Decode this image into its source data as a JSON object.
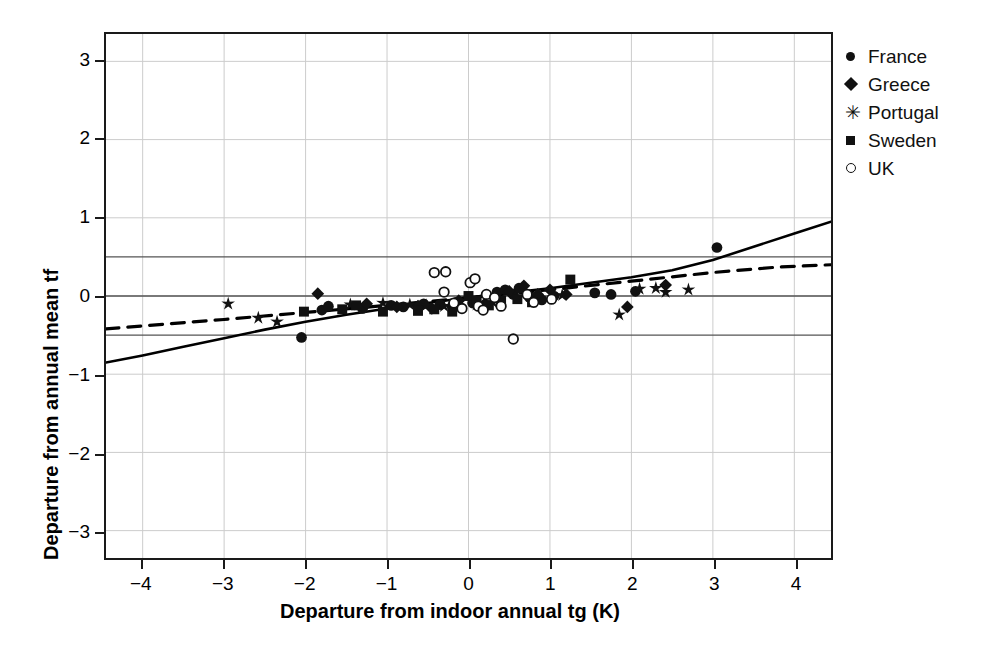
{
  "figure": {
    "caption_fragment": ""
  },
  "legend": {
    "position": "right",
    "entries": [
      {
        "label": "France",
        "marker": "filled-circle"
      },
      {
        "label": "Greece",
        "marker": "filled-diamond"
      },
      {
        "label": "Portugal",
        "marker": "star"
      },
      {
        "label": "Sweden",
        "marker": "filled-square"
      },
      {
        "label": "UK",
        "marker": "open-circle"
      }
    ]
  },
  "colors": {
    "marker": "#111111",
    "axis": "#1a1a1a",
    "grid": "#cccccc",
    "reference_line": "#555555",
    "background": "#ffffff"
  },
  "chart_data": {
    "type": "scatter",
    "title": "",
    "xlabel": "Departure from indoor annual tg (K)",
    "ylabel": "Departure from annual mean tf",
    "xlim": [
      -4.45,
      4.45
    ],
    "ylim": [
      -3.35,
      3.35
    ],
    "xticks": [
      -4,
      -3,
      -2,
      -1,
      0,
      1,
      2,
      3,
      4
    ],
    "yticks": [
      -3,
      -2,
      -1,
      0,
      1,
      2,
      3
    ],
    "xtick_labels": [
      "−4",
      "−3",
      "−2",
      "−1",
      "0",
      "1",
      "2",
      "3",
      "4"
    ],
    "ytick_labels": [
      "−3",
      "−2",
      "−1",
      "0",
      "1",
      "2",
      "3"
    ],
    "grid": true,
    "reference_lines": [
      {
        "y": 0.5,
        "style": "solid",
        "label": "+0.5 K comfort band"
      },
      {
        "y": 0.0,
        "style": "solid",
        "label": "0 K"
      },
      {
        "y": -0.5,
        "style": "solid",
        "label": "-0.5 K comfort band"
      }
    ],
    "curves": [
      {
        "name": "adaptive model (solid)",
        "style": "solid",
        "points": [
          [
            -4.45,
            -0.85
          ],
          [
            -4.0,
            -0.76
          ],
          [
            -3.5,
            -0.65
          ],
          [
            -3.0,
            -0.54
          ],
          [
            -2.5,
            -0.43
          ],
          [
            -2.0,
            -0.33
          ],
          [
            -1.5,
            -0.24
          ],
          [
            -1.0,
            -0.16
          ],
          [
            -0.5,
            -0.09
          ],
          [
            0.0,
            -0.02
          ],
          [
            0.5,
            0.04
          ],
          [
            1.0,
            0.1
          ],
          [
            1.5,
            0.17
          ],
          [
            2.0,
            0.24
          ],
          [
            2.5,
            0.33
          ],
          [
            3.0,
            0.46
          ],
          [
            3.5,
            0.63
          ],
          [
            4.0,
            0.8
          ],
          [
            4.45,
            0.95
          ]
        ]
      },
      {
        "name": "linear regression (dashed)",
        "style": "dashed",
        "points": [
          [
            -4.45,
            -0.42
          ],
          [
            -3.0,
            -0.3
          ],
          [
            -2.0,
            -0.21
          ],
          [
            -1.0,
            -0.12
          ],
          [
            0.0,
            -0.02
          ],
          [
            1.0,
            0.08
          ],
          [
            2.0,
            0.19
          ],
          [
            3.0,
            0.3
          ],
          [
            3.8,
            0.37
          ],
          [
            4.45,
            0.4
          ]
        ]
      }
    ],
    "series": [
      {
        "name": "France",
        "marker": "filled-circle",
        "points": [
          [
            -2.05,
            -0.53
          ],
          [
            -1.8,
            -0.18
          ],
          [
            -1.72,
            -0.13
          ],
          [
            -1.3,
            -0.16
          ],
          [
            -0.95,
            -0.12
          ],
          [
            -0.8,
            -0.14
          ],
          [
            -0.55,
            -0.1
          ],
          [
            -0.35,
            -0.11
          ],
          [
            -0.2,
            -0.13
          ],
          [
            0.05,
            -0.09
          ],
          [
            0.35,
            0.05
          ],
          [
            0.45,
            0.08
          ],
          [
            0.55,
            0.02
          ],
          [
            0.62,
            0.1
          ],
          [
            0.75,
            -0.02
          ],
          [
            0.9,
            -0.05
          ],
          [
            1.05,
            0.0
          ],
          [
            1.55,
            0.04
          ],
          [
            1.75,
            0.02
          ],
          [
            2.05,
            0.06
          ],
          [
            3.05,
            0.62
          ]
        ]
      },
      {
        "name": "Greece",
        "marker": "filled-diamond",
        "points": [
          [
            -1.85,
            0.03
          ],
          [
            -1.25,
            -0.1
          ],
          [
            -0.88,
            -0.14
          ],
          [
            -0.62,
            -0.13
          ],
          [
            -0.45,
            -0.16
          ],
          [
            -0.12,
            -0.06
          ],
          [
            0.2,
            -0.1
          ],
          [
            0.5,
            0.06
          ],
          [
            0.68,
            0.13
          ],
          [
            0.85,
            0.02
          ],
          [
            1.0,
            0.08
          ],
          [
            1.2,
            0.02
          ],
          [
            1.95,
            -0.14
          ],
          [
            2.42,
            0.14
          ]
        ]
      },
      {
        "name": "Portugal",
        "marker": "star",
        "points": [
          [
            -2.95,
            -0.1
          ],
          [
            -2.58,
            -0.28
          ],
          [
            -2.35,
            -0.33
          ],
          [
            -1.45,
            -0.11
          ],
          [
            -1.05,
            -0.09
          ],
          [
            -0.72,
            -0.11
          ],
          [
            -0.52,
            -0.12
          ],
          [
            -0.3,
            -0.13
          ],
          [
            0.1,
            -0.11
          ],
          [
            0.3,
            -0.08
          ],
          [
            1.15,
            0.01
          ],
          [
            1.85,
            -0.24
          ],
          [
            2.1,
            0.09
          ],
          [
            2.3,
            0.1
          ],
          [
            2.42,
            0.05
          ],
          [
            2.7,
            0.08
          ]
        ]
      },
      {
        "name": "Sweden",
        "marker": "filled-square",
        "points": [
          [
            -2.02,
            -0.2
          ],
          [
            -1.55,
            -0.17
          ],
          [
            -1.38,
            -0.12
          ],
          [
            -1.05,
            -0.2
          ],
          [
            -0.62,
            -0.19
          ],
          [
            -0.42,
            -0.17
          ],
          [
            -0.2,
            -0.2
          ],
          [
            0.0,
            0.0
          ],
          [
            0.1,
            -0.06
          ],
          [
            0.25,
            -0.12
          ],
          [
            0.4,
            -0.06
          ],
          [
            0.6,
            -0.04
          ],
          [
            0.78,
            -0.08
          ],
          [
            1.25,
            0.21
          ]
        ]
      },
      {
        "name": "UK",
        "marker": "open-circle",
        "points": [
          [
            -0.42,
            0.3
          ],
          [
            -0.28,
            0.31
          ],
          [
            -0.3,
            0.05
          ],
          [
            -0.18,
            -0.09
          ],
          [
            -0.08,
            -0.16
          ],
          [
            0.02,
            0.17
          ],
          [
            0.08,
            0.22
          ],
          [
            0.12,
            -0.13
          ],
          [
            0.18,
            -0.18
          ],
          [
            0.22,
            0.02
          ],
          [
            0.32,
            -0.02
          ],
          [
            0.4,
            -0.13
          ],
          [
            0.55,
            -0.55
          ],
          [
            0.72,
            0.02
          ],
          [
            0.8,
            -0.08
          ],
          [
            1.02,
            -0.04
          ]
        ]
      }
    ]
  }
}
